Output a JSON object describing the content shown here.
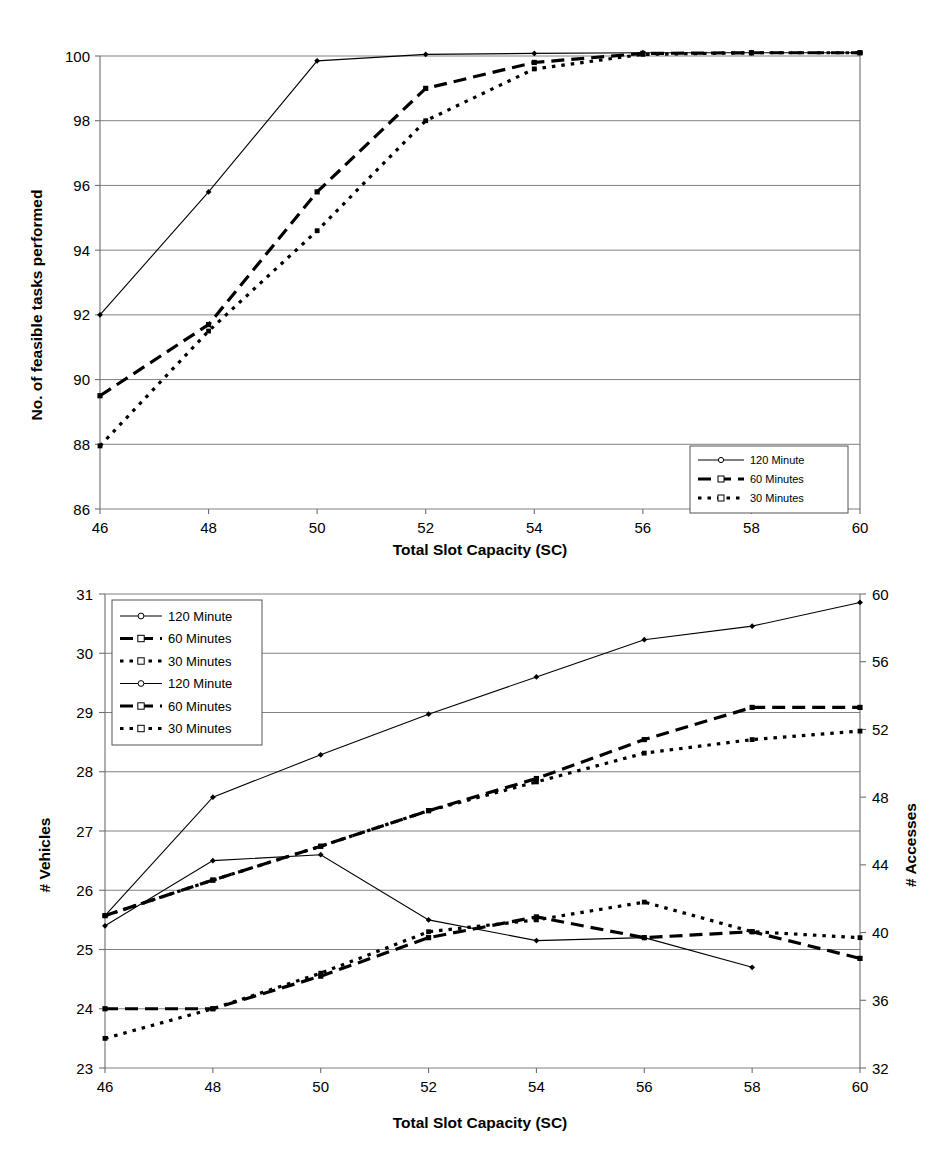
{
  "page": {
    "background_color": "#ffffff",
    "line_color": "#000000"
  },
  "chart_data": [
    {
      "id": "top-chart",
      "type": "line",
      "title": "",
      "xlabel": "Total Slot Capacity (SC)",
      "ylabel": "No. of feasible tasks performed",
      "x": [
        46,
        48,
        50,
        52,
        54,
        56,
        58,
        60
      ],
      "xticks": [
        "46",
        "48",
        "50",
        "52",
        "54",
        "56",
        "58",
        "60"
      ],
      "xlim": [
        46,
        60
      ],
      "ylim": [
        86,
        100
      ],
      "yticks": [
        "86",
        "88",
        "90",
        "92",
        "94",
        "96",
        "98",
        "100"
      ],
      "grid": true,
      "legend_position": "bottom-right",
      "series": [
        {
          "name": "120 Minute",
          "style": "solid-thin",
          "values": [
            92.0,
            95.8,
            99.85,
            100.05,
            100.08,
            100.1,
            100.1,
            100.1
          ]
        },
        {
          "name": "60 Minutes",
          "style": "dashed-thick",
          "values": [
            89.5,
            91.7,
            95.8,
            99.0,
            99.8,
            100.08,
            100.1,
            100.1
          ]
        },
        {
          "name": "30 Minutes",
          "style": "dotted-thick",
          "values": [
            87.95,
            91.5,
            94.6,
            98.0,
            99.6,
            100.05,
            100.1,
            100.1
          ]
        }
      ]
    },
    {
      "id": "bottom-chart",
      "type": "line",
      "title": "",
      "xlabel": "Total Slot Capacity (SC)",
      "ylabel": "# Vehicles",
      "ylabel_right": "# Accesses",
      "x": [
        46,
        48,
        50,
        52,
        54,
        56,
        58,
        60
      ],
      "xticks": [
        "46",
        "48",
        "50",
        "52",
        "54",
        "56",
        "58",
        "60"
      ],
      "xlim": [
        46,
        60
      ],
      "ylim": [
        23,
        31
      ],
      "yticks": [
        "23",
        "24",
        "25",
        "26",
        "27",
        "28",
        "29",
        "30",
        "31"
      ],
      "ylim_right": [
        32,
        60
      ],
      "yticks_right": [
        "32",
        "36",
        "40",
        "44",
        "48",
        "52",
        "56",
        "60"
      ],
      "grid": true,
      "legend_position": "top-left",
      "series": [
        {
          "name": "120 Minute",
          "axis": "right",
          "group": "accesses",
          "style": "solid-thin",
          "values": [
            41.0,
            48.0,
            50.5,
            52.9,
            55.1,
            57.3,
            58.1,
            59.5
          ]
        },
        {
          "name": "60 Minutes",
          "axis": "right",
          "group": "accesses",
          "style": "dashed-thick",
          "values": [
            41.0,
            43.1,
            45.1,
            47.2,
            49.1,
            51.4,
            53.3,
            53.3
          ]
        },
        {
          "name": "30 Minutes",
          "axis": "right",
          "group": "accesses",
          "style": "dotted-thick",
          "values": [
            41.0,
            43.1,
            45.1,
            47.2,
            48.9,
            50.6,
            51.4,
            51.9
          ]
        },
        {
          "name": "120 Minute",
          "axis": "left",
          "group": "vehicles",
          "style": "solid-thin",
          "values": [
            25.4,
            26.5,
            26.6,
            25.5,
            25.15,
            25.2,
            24.7,
            null
          ]
        },
        {
          "name": "60 Minutes",
          "axis": "left",
          "group": "vehicles",
          "style": "dashed-thick",
          "values": [
            24.0,
            24.0,
            24.55,
            25.2,
            25.55,
            25.2,
            25.3,
            24.85
          ]
        },
        {
          "name": "30 Minutes",
          "axis": "left",
          "group": "vehicles",
          "style": "dotted-thick",
          "values": [
            23.5,
            24.0,
            24.6,
            25.3,
            25.5,
            25.8,
            25.3,
            25.2
          ]
        }
      ]
    }
  ],
  "top_chart": {
    "y_axis_title": "No. of feasible tasks performed",
    "x_axis_title": "Total Slot Capacity (SC)",
    "y_ticks": [
      "100",
      "98",
      "96",
      "94",
      "92",
      "90",
      "88",
      "86"
    ],
    "x_ticks": [
      "46",
      "48",
      "50",
      "52",
      "54",
      "56",
      "58",
      "60"
    ],
    "legend": [
      {
        "label": "120 Minute",
        "style": "solid-thin"
      },
      {
        "label": "60 Minutes",
        "style": "dashed-thick"
      },
      {
        "label": "30 Minutes",
        "style": "dotted-thick"
      }
    ]
  },
  "bottom_chart": {
    "y_axis_title": "# Vehicles",
    "y_axis_title_right": "# Accesses",
    "x_axis_title": "Total Slot Capacity (SC)",
    "y_ticks": [
      "31",
      "30",
      "29",
      "28",
      "27",
      "26",
      "25",
      "24",
      "23"
    ],
    "y_ticks_right": [
      "60",
      "56",
      "52",
      "48",
      "44",
      "40",
      "36",
      "32"
    ],
    "x_ticks": [
      "46",
      "48",
      "50",
      "52",
      "54",
      "56",
      "58",
      "60"
    ],
    "legend": [
      {
        "label": "120 Minute",
        "style": "solid-thin"
      },
      {
        "label": "60 Minutes",
        "style": "dashed-thick"
      },
      {
        "label": "30 Minutes",
        "style": "dotted-thick"
      },
      {
        "label": "120 Minute",
        "style": "solid-thin"
      },
      {
        "label": "60 Minutes",
        "style": "dashed-thick"
      },
      {
        "label": "30 Minutes",
        "style": "dotted-thick"
      }
    ]
  }
}
